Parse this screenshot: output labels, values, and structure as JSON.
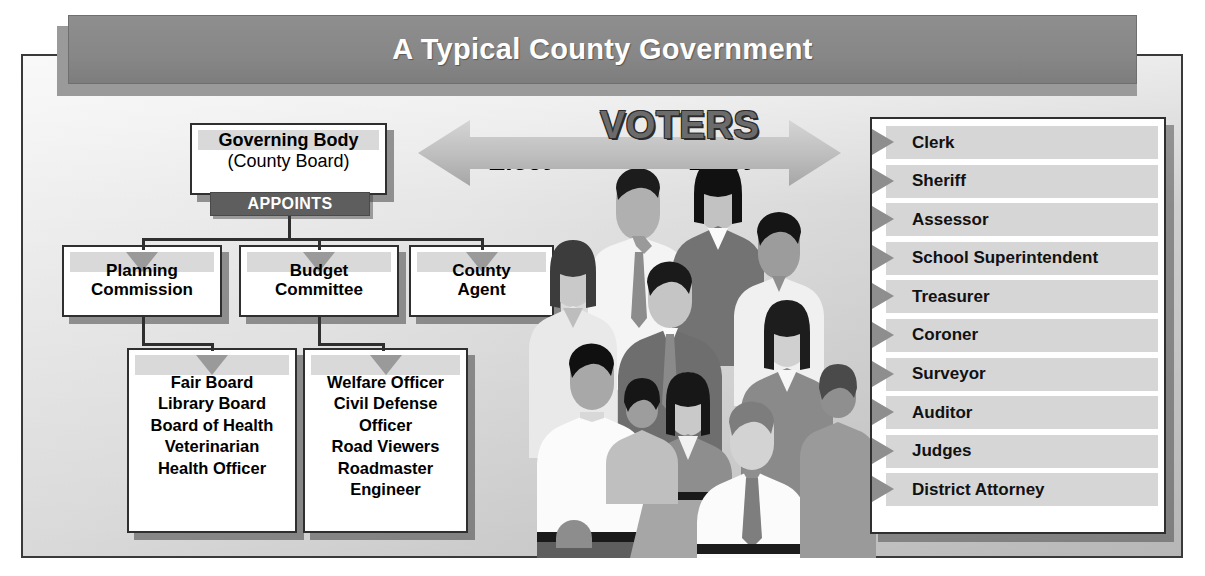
{
  "title": {
    "text": "A Typical County Government"
  },
  "governing": {
    "name": "Governing Body",
    "sub": "(County Board)",
    "appoints_label": "APPOINTS"
  },
  "appointed_boxes": [
    {
      "line1": "Planning",
      "line2": "Commission"
    },
    {
      "line1": "Budget",
      "line2": "Committee"
    },
    {
      "line1": "County",
      "line2": "Agent"
    }
  ],
  "appointed_lists": [
    {
      "items": [
        "Fair Board",
        "Library Board",
        "Board of Health",
        "Veterinarian",
        "Health Officer"
      ]
    },
    {
      "items": [
        "Welfare Officer",
        "Civil Defense",
        "Officer",
        "Road Viewers",
        "Roadmaster",
        "Engineer"
      ]
    }
  ],
  "voters": {
    "label": "VOTERS",
    "elect_left": "Elect",
    "elect_right": "Elect"
  },
  "elected_officials": [
    "Clerk",
    "Sheriff",
    "Assessor",
    "School Superintendent",
    "Treasurer",
    "Coroner",
    "Surveyor",
    "Auditor",
    "Judges",
    "District Attorney"
  ],
  "colors": {
    "title_bar": "#878787",
    "appoints_banner": "#5e5e5e",
    "box_border": "#2f2f2f",
    "row_band": "#d6d6d6",
    "chevron": "#8e8e8e",
    "arrow": "#b4b4b4",
    "voters_text": "#6b6b6b"
  }
}
